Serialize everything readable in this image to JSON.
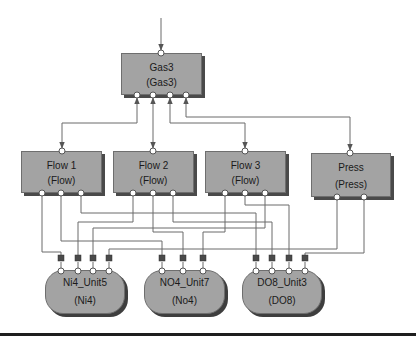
{
  "diagram": {
    "top_node": {
      "name": "Gas3",
      "type": "(Gas3)"
    },
    "sensor_nodes": [
      {
        "name": "Flow 1",
        "type": "(Flow)"
      },
      {
        "name": "Flow 2",
        "type": "(Flow)"
      },
      {
        "name": "Flow 3",
        "type": "(Flow)"
      },
      {
        "name": "Press",
        "type": "(Press)"
      }
    ],
    "unit_nodes": [
      {
        "name": "Ni4_Unit5",
        "type": "(Ni4)"
      },
      {
        "name": "NO4_Unit7",
        "type": "(No4)"
      },
      {
        "name": "DO8_Unit3",
        "type": "(DO8)"
      }
    ],
    "colors": {
      "node_fill": "#a3a3a3",
      "node_shadow": "#4a4a4a",
      "wire": "#6a6a6a",
      "port": "#ffffff",
      "marker": "#4a4a4a"
    }
  }
}
